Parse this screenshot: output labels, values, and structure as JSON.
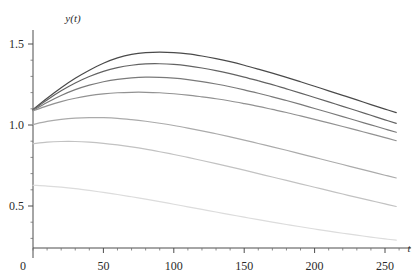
{
  "chart_data": {
    "type": "line",
    "title": "",
    "subtitle": "",
    "xlabel": "t",
    "ylabel": "y(t)",
    "xlim": [
      0,
      260
    ],
    "ylim": [
      0.24,
      1.62
    ],
    "grid": false,
    "legend": "none",
    "x_ticks": [
      50,
      100,
      150,
      200,
      250
    ],
    "x_tick_labels": [
      "50",
      "100",
      "150",
      "200",
      "250"
    ],
    "x_minor_step": 10,
    "y_ticks": [
      0,
      0.5,
      1.0,
      1.5
    ],
    "y_tick_labels": [
      "0",
      "0.5",
      "1.0",
      "1.5"
    ],
    "y_minor_step": 0.1,
    "origin_label": "0",
    "x": [
      0,
      10,
      20,
      30,
      40,
      50,
      60,
      70,
      80,
      90,
      100,
      110,
      120,
      130,
      140,
      150,
      160,
      170,
      180,
      190,
      200,
      210,
      220,
      230,
      240,
      250,
      258
    ],
    "series": [
      {
        "name": "curve-1",
        "color": "#4a4a4a",
        "values": [
          1.095,
          1.165,
          1.23,
          1.288,
          1.338,
          1.381,
          1.414,
          1.436,
          1.447,
          1.45,
          1.447,
          1.439,
          1.426,
          1.41,
          1.391,
          1.369,
          1.345,
          1.32,
          1.294,
          1.267,
          1.239,
          1.211,
          1.183,
          1.155,
          1.126,
          1.098,
          1.076
        ]
      },
      {
        "name": "curve-2",
        "color": "#636363",
        "values": [
          1.093,
          1.155,
          1.211,
          1.259,
          1.299,
          1.331,
          1.354,
          1.369,
          1.377,
          1.378,
          1.374,
          1.365,
          1.352,
          1.336,
          1.317,
          1.296,
          1.273,
          1.249,
          1.223,
          1.197,
          1.17,
          1.143,
          1.115,
          1.088,
          1.06,
          1.032,
          1.01
        ]
      },
      {
        "name": "curve-3",
        "color": "#7a7a7a",
        "values": [
          1.09,
          1.139,
          1.182,
          1.218,
          1.246,
          1.267,
          1.282,
          1.291,
          1.295,
          1.294,
          1.289,
          1.28,
          1.268,
          1.253,
          1.236,
          1.217,
          1.196,
          1.174,
          1.151,
          1.127,
          1.102,
          1.077,
          1.052,
          1.026,
          1.001,
          0.975,
          0.955
        ]
      },
      {
        "name": "curve-4",
        "color": "#929292",
        "values": [
          1.087,
          1.118,
          1.144,
          1.165,
          1.181,
          1.192,
          1.199,
          1.202,
          1.202,
          1.199,
          1.193,
          1.185,
          1.174,
          1.162,
          1.148,
          1.132,
          1.115,
          1.096,
          1.077,
          1.056,
          1.035,
          1.013,
          0.991,
          0.968,
          0.945,
          0.922,
          0.903
        ]
      },
      {
        "name": "curve-5",
        "color": "#ababab",
        "values": [
          1.003,
          1.022,
          1.035,
          1.043,
          1.046,
          1.045,
          1.041,
          1.033,
          1.023,
          1.011,
          0.997,
          0.981,
          0.964,
          0.946,
          0.927,
          0.907,
          0.886,
          0.865,
          0.844,
          0.822,
          0.8,
          0.778,
          0.756,
          0.734,
          0.712,
          0.69,
          0.673
        ]
      },
      {
        "name": "curve-6",
        "color": "#c2c2c2",
        "values": [
          0.885,
          0.894,
          0.898,
          0.898,
          0.894,
          0.887,
          0.877,
          0.865,
          0.851,
          0.835,
          0.818,
          0.8,
          0.781,
          0.762,
          0.742,
          0.721,
          0.7,
          0.679,
          0.658,
          0.637,
          0.616,
          0.595,
          0.574,
          0.553,
          0.533,
          0.513,
          0.497
        ]
      },
      {
        "name": "curve-7",
        "color": "#dcdcdc",
        "values": [
          0.628,
          0.623,
          0.616,
          0.607,
          0.596,
          0.584,
          0.571,
          0.557,
          0.542,
          0.527,
          0.511,
          0.495,
          0.479,
          0.463,
          0.447,
          0.431,
          0.416,
          0.401,
          0.386,
          0.372,
          0.358,
          0.345,
          0.332,
          0.32,
          0.308,
          0.297,
          0.289
        ]
      }
    ]
  }
}
